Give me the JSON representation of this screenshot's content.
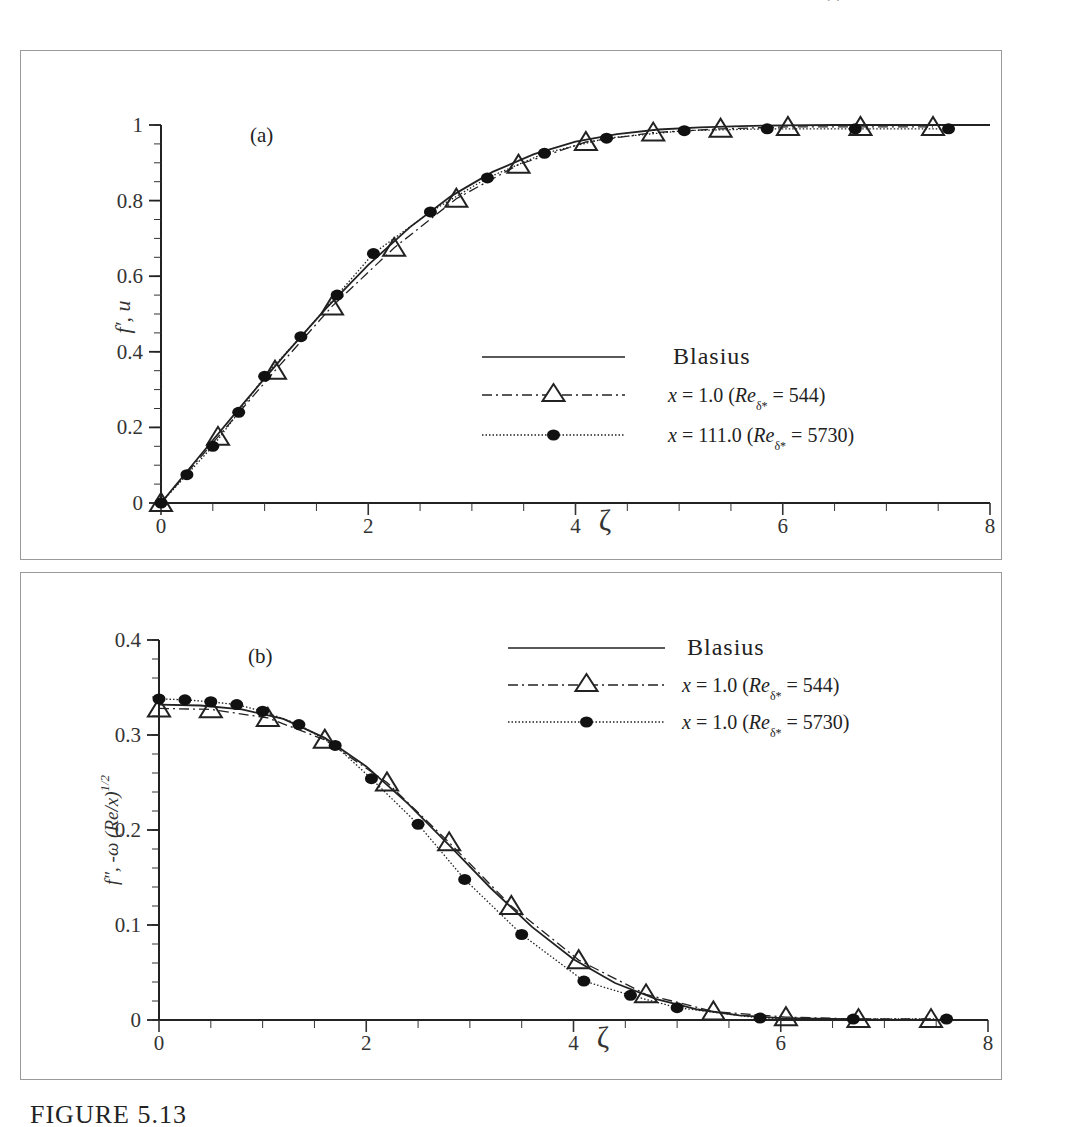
{
  "page": {
    "caption": "FIGURE 5.13",
    "top_fragment": "· ·"
  },
  "chart_data": [
    {
      "panel": "(a)",
      "type": "line",
      "title": "(a)",
      "xlabel": "ζ",
      "ylabel": "f′, u",
      "xlim": [
        0,
        8
      ],
      "ylim": [
        0,
        1
      ],
      "xticks": [
        "0",
        "2",
        "4",
        "6",
        "8"
      ],
      "yticks": [
        "0",
        "0.2",
        "0.4",
        "0.6",
        "0.8",
        "1"
      ],
      "grid": false,
      "legend_position": "center-right",
      "series": [
        {
          "name": "Blasius",
          "style": "solid",
          "marker": "none",
          "x": [
            0,
            0.4,
            0.8,
            1.2,
            1.6,
            2.0,
            2.4,
            2.8,
            3.2,
            3.6,
            4.0,
            4.4,
            4.8,
            5.2,
            5.6,
            6.0,
            6.5,
            7.0,
            7.5,
            8.0
          ],
          "y": [
            0,
            0.133,
            0.265,
            0.394,
            0.517,
            0.63,
            0.729,
            0.812,
            0.876,
            0.923,
            0.956,
            0.976,
            0.988,
            0.994,
            0.997,
            0.999,
            1.0,
            1.0,
            1.0,
            1.0
          ]
        },
        {
          "name": "x = 1.0 (Re_δ* = 544)",
          "legend_parts": {
            "main": "x = 1.0 (Re",
            "sub": "δ*",
            "tail": " = 544)"
          },
          "style": "dash-dot",
          "marker": "open-triangle",
          "x": [
            0,
            0.55,
            1.1,
            1.65,
            2.25,
            2.85,
            3.45,
            4.1,
            4.75,
            5.4,
            6.05,
            6.75,
            7.45
          ],
          "y": [
            0,
            0.175,
            0.35,
            0.52,
            0.675,
            0.805,
            0.895,
            0.955,
            0.98,
            0.99,
            0.995,
            0.995,
            0.995
          ]
        },
        {
          "name": "x = 111.0 (Re_δ* = 5730)",
          "legend_parts": {
            "main": "x = 111.0 (Re",
            "sub": "δ*",
            "tail": " = 5730)"
          },
          "style": "dotted",
          "marker": "filled-circle",
          "x": [
            0,
            0.25,
            0.5,
            0.75,
            1.0,
            1.35,
            1.7,
            2.05,
            2.6,
            3.15,
            3.7,
            4.3,
            5.05,
            5.85,
            6.7,
            7.6
          ],
          "y": [
            0,
            0.075,
            0.15,
            0.24,
            0.335,
            0.44,
            0.55,
            0.66,
            0.77,
            0.86,
            0.925,
            0.965,
            0.985,
            0.99,
            0.99,
            0.99
          ]
        }
      ]
    },
    {
      "panel": "(b)",
      "type": "line",
      "title": "(b)",
      "xlabel": "ζ",
      "ylabel": "f″, -ω (Re/x)^1/2",
      "ylabel_parts": {
        "main": "f″, -ω (Re/x)",
        "sup": "1/2"
      },
      "xlim": [
        0,
        8
      ],
      "ylim": [
        0,
        0.4
      ],
      "xticks": [
        "0",
        "2",
        "4",
        "6",
        "8"
      ],
      "yticks": [
        "0",
        "0.1",
        "0.2",
        "0.3",
        "0.4"
      ],
      "grid": false,
      "legend_position": "upper-right",
      "series": [
        {
          "name": "Blasius",
          "style": "solid",
          "marker": "none",
          "x": [
            0,
            0.4,
            0.8,
            1.2,
            1.6,
            2.0,
            2.4,
            2.8,
            3.2,
            3.6,
            4.0,
            4.4,
            4.8,
            5.2,
            5.6,
            6.0,
            6.5,
            7.0,
            7.5,
            8.0
          ],
          "y": [
            0.332,
            0.331,
            0.327,
            0.317,
            0.297,
            0.267,
            0.228,
            0.184,
            0.139,
            0.098,
            0.064,
            0.039,
            0.022,
            0.011,
            0.005,
            0.002,
            0.001,
            0.0,
            0.0,
            0.0
          ]
        },
        {
          "name": "x = 1.0 (Re_δ* = 544)",
          "legend_parts": {
            "main": "x = 1.0 (Re",
            "sub": "δ*",
            "tail": " = 544)"
          },
          "style": "dash-dot",
          "marker": "open-triangle",
          "x": [
            0,
            0.5,
            1.05,
            1.6,
            2.2,
            2.8,
            3.4,
            4.05,
            4.7,
            5.35,
            6.05,
            6.75,
            7.45
          ],
          "y": [
            0.328,
            0.327,
            0.318,
            0.295,
            0.25,
            0.187,
            0.12,
            0.063,
            0.027,
            0.009,
            0.003,
            0.001,
            0.001
          ]
        },
        {
          "name": "x = 1.0 (Re_δ* = 5730)",
          "legend_parts": {
            "main": "x = 1.0 (Re",
            "sub": "δ*",
            "tail": " = 5730)"
          },
          "style": "dotted",
          "marker": "filled-circle",
          "x": [
            0,
            0.25,
            0.5,
            0.75,
            1.0,
            1.35,
            1.7,
            2.05,
            2.5,
            2.95,
            3.5,
            4.1,
            4.55,
            5.0,
            5.8,
            6.7,
            7.6
          ],
          "y": [
            0.338,
            0.337,
            0.335,
            0.332,
            0.325,
            0.311,
            0.289,
            0.254,
            0.206,
            0.148,
            0.09,
            0.041,
            0.026,
            0.013,
            0.002,
            0.001,
            0.001
          ]
        }
      ]
    }
  ]
}
